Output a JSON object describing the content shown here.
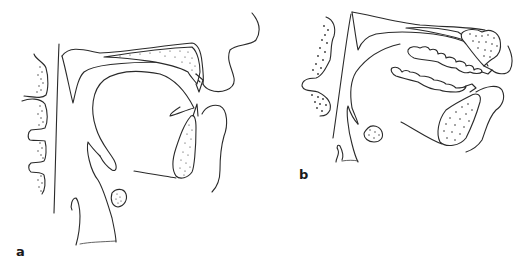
{
  "figure": {
    "background_color": "#ffffff",
    "line_color": "#2a2a2a",
    "panels": [
      {
        "id": "a",
        "label": "a",
        "state": "mouth closed, tongue at rest",
        "structures": [
          "cervical-vertebrae",
          "posterior-pharyngeal-wall",
          "hard-palate",
          "soft-palate",
          "tongue",
          "epiglottis",
          "hyoid-bone",
          "larynx",
          "mandible",
          "upper-incisor",
          "lower-incisor",
          "upper-lip",
          "lower-lip-chin",
          "nose"
        ]
      },
      {
        "id": "b",
        "label": "b",
        "state": "mouth opened, head extended, teeth visible",
        "structures": [
          "cervical-vertebrae",
          "posterior-pharyngeal-wall",
          "hard-palate",
          "maxilla",
          "upper-teeth",
          "lower-teeth",
          "tongue",
          "epiglottis",
          "hyoid-bone",
          "larynx",
          "mandible",
          "upper-incisor",
          "lower-incisor",
          "upper-lip",
          "lower-lip-chin"
        ]
      }
    ]
  }
}
